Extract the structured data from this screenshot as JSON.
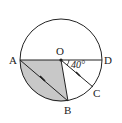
{
  "diagram": {
    "type": "circle-geometry",
    "points": {
      "A": {
        "label": "A"
      },
      "B": {
        "label": "B"
      },
      "C": {
        "label": "C"
      },
      "D": {
        "label": "D"
      },
      "O": {
        "label": "O"
      }
    },
    "angle_label": "40°",
    "colors": {
      "shade": "#c8c8c8",
      "stroke": "#222222"
    }
  }
}
